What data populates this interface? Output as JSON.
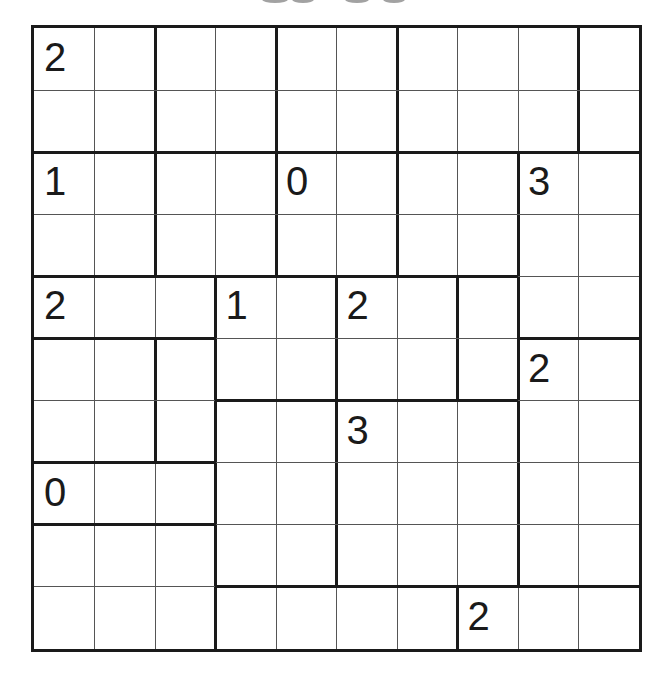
{
  "puzzle": {
    "type": "region-numbers-grid",
    "rows": 10,
    "cols": 10,
    "title_visible": false,
    "regions": [
      "AABBCCDDDE",
      "AABBCCDDDE",
      "FFGGHHIIJJ",
      "FFGGHHIIJJ",
      "KKKLLMMNJJ",
      "OOPLLMMNRR",
      "OOPQQSSSRR",
      "WWWQQSSSRR",
      "TTTQQSSSRR",
      "TTTUUUUVVV"
    ],
    "clues": [
      {
        "row": 0,
        "col": 0,
        "value": "2"
      },
      {
        "row": 2,
        "col": 0,
        "value": "1"
      },
      {
        "row": 2,
        "col": 4,
        "value": "0"
      },
      {
        "row": 2,
        "col": 8,
        "value": "3"
      },
      {
        "row": 4,
        "col": 0,
        "value": "2"
      },
      {
        "row": 4,
        "col": 3,
        "value": "1"
      },
      {
        "row": 4,
        "col": 5,
        "value": "2"
      },
      {
        "row": 5,
        "col": 8,
        "value": "2"
      },
      {
        "row": 6,
        "col": 5,
        "value": "3"
      },
      {
        "row": 7,
        "col": 0,
        "value": "0"
      },
      {
        "row": 9,
        "col": 7,
        "value": "2"
      }
    ],
    "colors": {
      "thick_line": "#1a1a1a",
      "thin_line": "#555555",
      "background": "#ffffff"
    }
  }
}
